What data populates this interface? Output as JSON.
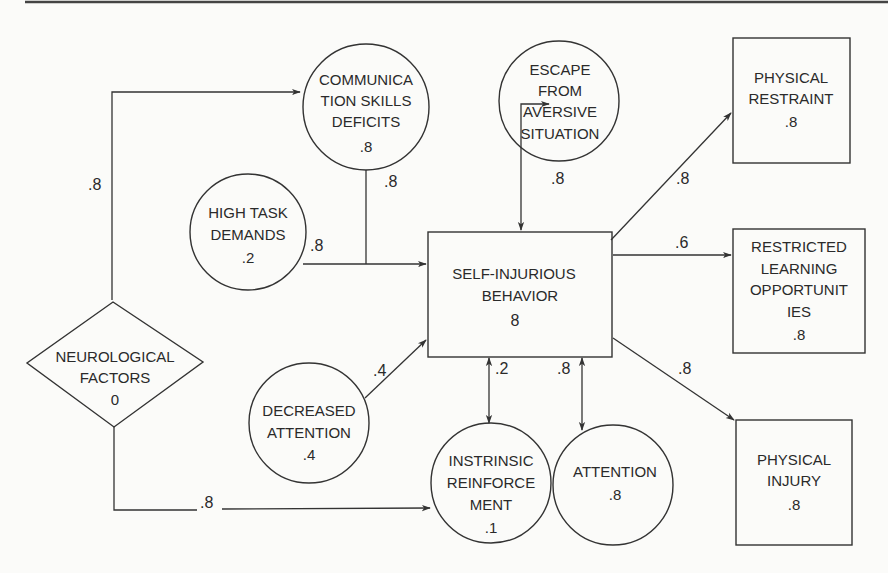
{
  "diagram": {
    "type": "causal path diagram",
    "nodes": {
      "communication": {
        "lines": [
          "COMMUNICA",
          "TION SKILLS",
          "DEFICITS",
          ".8"
        ],
        "shape": "circle"
      },
      "high_task": {
        "lines": [
          "HIGH TASK",
          "DEMANDS",
          ".2"
        ],
        "shape": "circle"
      },
      "neurological": {
        "lines": [
          "NEUROLOGICAL",
          "FACTORS",
          "0"
        ],
        "shape": "diamond"
      },
      "decreased_attention": {
        "lines": [
          "DECREASED",
          "ATTENTION",
          ".4"
        ],
        "shape": "circle"
      },
      "sib": {
        "lines": [
          "SELF-INJURIOUS",
          "BEHAVIOR",
          "8"
        ],
        "shape": "rectangle"
      },
      "escape": {
        "lines": [
          "ESCAPE",
          "FROM",
          "AVERSIVE",
          "SITUATION"
        ],
        "shape": "circle"
      },
      "physical_restraint": {
        "lines": [
          "PHYSICAL",
          "RESTRAINT",
          ".8"
        ],
        "shape": "rectangle"
      },
      "restricted_learning": {
        "lines": [
          "RESTRICTED",
          "LEARNING",
          "OPPORTUNIT",
          "IES",
          ".8"
        ],
        "shape": "rectangle"
      },
      "intrinsic": {
        "lines": [
          "INSTRINSIC",
          "REINFORCE",
          "MENT",
          ".1"
        ],
        "shape": "circle"
      },
      "attention": {
        "lines": [
          "ATTENTION",
          ".8"
        ],
        "shape": "circle"
      },
      "physical_injury": {
        "lines": [
          "PHYSICAL",
          "INJURY",
          ".8"
        ],
        "shape": "rectangle"
      }
    },
    "edges": {
      "neuro_to_comm": {
        "from": "NEUROLOGICAL FACTORS",
        "to": "COMMUNICATION SKILLS DEFICITS",
        "label": ".8"
      },
      "comm_to_sib": {
        "from": "COMMUNICATION SKILLS DEFICITS",
        "to": "SELF-INJURIOUS BEHAVIOR",
        "label": ".8"
      },
      "task_to_sib": {
        "from": "HIGH TASK DEMANDS",
        "to": "SELF-INJURIOUS BEHAVIOR",
        "label": ".8"
      },
      "decatt_to_sib": {
        "from": "DECREASED ATTENTION",
        "to": "SELF-INJURIOUS BEHAVIOR",
        "label": ".4"
      },
      "sib_escape": {
        "from": "SELF-INJURIOUS BEHAVIOR",
        "to": "ESCAPE FROM AVERSIVE SITUATION",
        "label": ".8",
        "bidirectional": true
      },
      "sib_to_restraint": {
        "from": "SELF-INJURIOUS BEHAVIOR",
        "to": "PHYSICAL RESTRAINT",
        "label": ".8"
      },
      "sib_to_learning": {
        "from": "SELF-INJURIOUS BEHAVIOR",
        "to": "RESTRICTED LEARNING OPPORTUNITIES",
        "label": ".6"
      },
      "sib_to_injury": {
        "from": "SELF-INJURIOUS BEHAVIOR",
        "to": "PHYSICAL INJURY",
        "label": ".8"
      },
      "sib_intrinsic": {
        "from": "SELF-INJURIOUS BEHAVIOR",
        "to": "INSTRINSIC REINFORCEMENT",
        "label": ".2",
        "bidirectional": true
      },
      "sib_attention": {
        "from": "SELF-INJURIOUS BEHAVIOR",
        "to": "ATTENTION",
        "label": ".8",
        "bidirectional": true
      },
      "neuro_to_intrinsic": {
        "from": "NEUROLOGICAL FACTORS",
        "to": "INSTRINSIC REINFORCEMENT",
        "label": ".8"
      }
    }
  }
}
